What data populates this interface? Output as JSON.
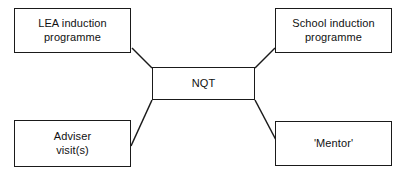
{
  "diagram": {
    "type": "hub-and-spoke",
    "title": "",
    "center": {
      "id": "nqt",
      "label": "NQT"
    },
    "nodes": [
      {
        "id": "lea",
        "label": "LEA induction\nprogramme",
        "position": "top-left"
      },
      {
        "id": "school",
        "label": "School induction\nprogramme",
        "position": "top-right"
      },
      {
        "id": "adviser",
        "label": "Adviser\nvisit(s)",
        "position": "bottom-left"
      },
      {
        "id": "mentor",
        "label": "'Mentor'",
        "position": "bottom-right"
      }
    ],
    "connectors": [
      {
        "from": "nqt",
        "to": "lea",
        "x1": 152,
        "y1": 68,
        "x2": 132,
        "y2": 48
      },
      {
        "from": "nqt",
        "to": "school",
        "x1": 255,
        "y1": 68,
        "x2": 275,
        "y2": 48
      },
      {
        "from": "nqt",
        "to": "adviser",
        "x1": 152,
        "y1": 100,
        "x2": 131,
        "y2": 146
      },
      {
        "from": "nqt",
        "to": "mentor",
        "x1": 255,
        "y1": 100,
        "x2": 276,
        "y2": 140
      }
    ],
    "colors": {
      "stroke": "#1a1a1a",
      "fill": "#ffffff",
      "text": "#111111"
    }
  }
}
